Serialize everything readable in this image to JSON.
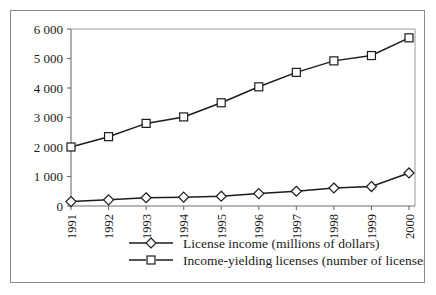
{
  "chart_data": {
    "type": "line",
    "title": "",
    "subtitle": "",
    "xlabel": "",
    "ylabel": "",
    "categories": [
      "1991",
      "1992",
      "1993",
      "1994",
      "1995",
      "1996",
      "1997",
      "1998",
      "1999",
      "2000"
    ],
    "ylim": [
      0,
      6000
    ],
    "ytick_values": [
      0,
      1000,
      2000,
      3000,
      4000,
      5000,
      6000
    ],
    "ytick_labels": [
      "0",
      "1 000",
      "2 000",
      "3 000",
      "4 000",
      "5 000",
      "6 000"
    ],
    "grid": false,
    "legend_position": "bottom",
    "xtick_rotation": -90,
    "series": [
      {
        "name": "License income (millions of dollars)",
        "marker": "diamond",
        "color": "#1c1c1c",
        "values": [
          150,
          210,
          280,
          300,
          330,
          420,
          500,
          610,
          660,
          1120
        ]
      },
      {
        "name": "Income-yielding licenses (number of licenses)",
        "marker": "square",
        "color": "#1c1c1c",
        "values": [
          2000,
          2350,
          2800,
          3020,
          3500,
          4040,
          4530,
          4920,
          5100,
          5700
        ]
      }
    ]
  },
  "legend": {
    "items": [
      {
        "label": "License income (millions of dollars)",
        "marker": "diamond-marker-icon"
      },
      {
        "label": "Income-yielding licenses (number of licenses)",
        "marker": "square-marker-icon"
      }
    ]
  }
}
